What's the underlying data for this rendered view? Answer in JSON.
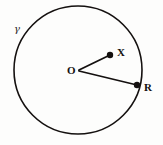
{
  "figure": {
    "type": "geometry-diagram",
    "background_color": "#fdfdfc",
    "stroke_color": "#14100f"
  },
  "labels": {
    "circle_name": "γ",
    "center": "O",
    "interior_point": "X",
    "boundary_point": "R"
  },
  "geometry": {
    "circle": {
      "center_x": 78,
      "center_y": 70,
      "radius": 64,
      "stroke_width": 1.6
    },
    "points": [
      {
        "id": "O",
        "label": "O",
        "x": 78,
        "y": 70,
        "dot_radius": 0,
        "label_x": 67,
        "label_y": 74,
        "on_circle": false
      },
      {
        "id": "X",
        "label": "X",
        "x": 110,
        "y": 55,
        "dot_radius": 3.2,
        "label_x": 117,
        "label_y": 56,
        "on_circle": false
      },
      {
        "id": "R",
        "label": "R",
        "x": 137,
        "y": 85,
        "dot_radius": 3.2,
        "label_x": 144,
        "label_y": 91,
        "on_circle": true
      }
    ],
    "segments": [
      {
        "id": "OX",
        "from": "O",
        "to": "X",
        "x1": 79,
        "y1": 70,
        "x2": 110,
        "y2": 55,
        "stroke_width": 1.8
      },
      {
        "id": "OR",
        "from": "O",
        "to": "R",
        "x1": 79,
        "y1": 71,
        "x2": 137,
        "y2": 85,
        "stroke_width": 1.8
      }
    ],
    "gamma_label": {
      "x": 14,
      "y": 32
    }
  },
  "font_sizes": {
    "point_label": 11,
    "gamma_label": 10
  }
}
